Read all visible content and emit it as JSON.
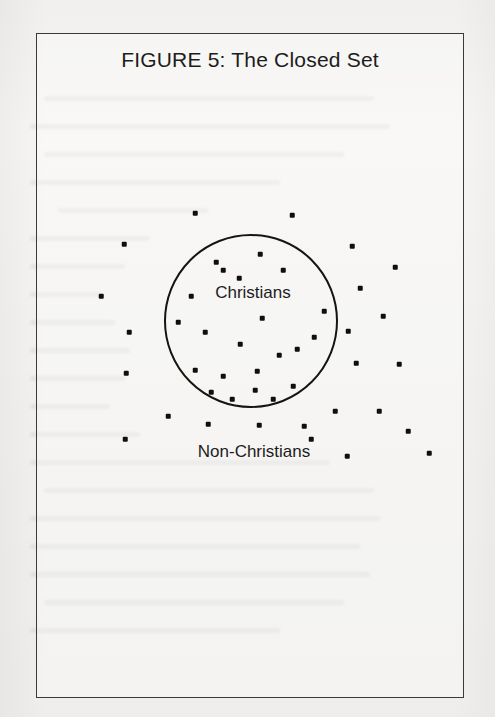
{
  "document": {
    "background_color": "#f6f5f3",
    "ink_color": "#1d1c1b"
  },
  "figure": {
    "title": "FIGURE 5: The Closed Set",
    "frame": {
      "x": 36,
      "y": 33,
      "width": 428,
      "height": 665,
      "border_color": "#3b3a38"
    }
  },
  "labels": {
    "inside": "Christians",
    "outside": "Non-Christians"
  },
  "ghost_text_lines": [
    {
      "x": 44,
      "y": 96,
      "w": 330
    },
    {
      "x": 30,
      "y": 124,
      "w": 360
    },
    {
      "x": 44,
      "y": 152,
      "w": 300
    },
    {
      "x": 30,
      "y": 180,
      "w": 250
    },
    {
      "x": 58,
      "y": 208,
      "w": 150
    },
    {
      "x": 30,
      "y": 236,
      "w": 120
    },
    {
      "x": 30,
      "y": 264,
      "w": 95
    },
    {
      "x": 30,
      "y": 292,
      "w": 70
    },
    {
      "x": 30,
      "y": 320,
      "w": 85
    },
    {
      "x": 30,
      "y": 348,
      "w": 100
    },
    {
      "x": 30,
      "y": 376,
      "w": 95
    },
    {
      "x": 30,
      "y": 404,
      "w": 80
    },
    {
      "x": 30,
      "y": 432,
      "w": 110
    },
    {
      "x": 30,
      "y": 460,
      "w": 300
    },
    {
      "x": 44,
      "y": 488,
      "w": 330
    },
    {
      "x": 30,
      "y": 516,
      "w": 350
    },
    {
      "x": 30,
      "y": 544,
      "w": 330
    },
    {
      "x": 30,
      "y": 572,
      "w": 340
    },
    {
      "x": 44,
      "y": 600,
      "w": 300
    },
    {
      "x": 30,
      "y": 628,
      "w": 250
    }
  ],
  "chart_data": {
    "type": "scatter",
    "title": "FIGURE 5: The Closed Set",
    "subtitle": "",
    "xlabel": "",
    "ylabel": "",
    "grid": false,
    "legend_position": "none",
    "boundary": {
      "shape": "circle",
      "center": [
        250,
        320
      ],
      "radius": 87,
      "stroke": "#15140f",
      "stroke_width": 2,
      "fill": "none"
    },
    "annotations": [
      {
        "text": "Christians",
        "x": 252,
        "y": 292
      },
      {
        "text": "Non-Christians",
        "x": 253,
        "y": 451
      }
    ],
    "series": [
      {
        "name": "Christians",
        "region": "inside",
        "marker": "square-dot",
        "color": "#100f0d",
        "count": 22,
        "points": [
          [
            215,
            261
          ],
          [
            222,
            269
          ],
          [
            259,
            253
          ],
          [
            238,
            277
          ],
          [
            282,
            269
          ],
          [
            190,
            295
          ],
          [
            177,
            321
          ],
          [
            261,
            317
          ],
          [
            323,
            310
          ],
          [
            204,
            331
          ],
          [
            239,
            343
          ],
          [
            313,
            336
          ],
          [
            296,
            348
          ],
          [
            278,
            354
          ],
          [
            194,
            369
          ],
          [
            222,
            375
          ],
          [
            256,
            370
          ],
          [
            254,
            389
          ],
          [
            292,
            385
          ],
          [
            231,
            398
          ],
          [
            210,
            391
          ],
          [
            272,
            398
          ]
        ]
      },
      {
        "name": "Non-Christians",
        "region": "outside",
        "marker": "square-dot",
        "color": "#100f0d",
        "count": 24,
        "points": [
          [
            194,
            212
          ],
          [
            291,
            214
          ],
          [
            123,
            243
          ],
          [
            351,
            245
          ],
          [
            100,
            295
          ],
          [
            394,
            266
          ],
          [
            359,
            287
          ],
          [
            128,
            331
          ],
          [
            382,
            315
          ],
          [
            347,
            330
          ],
          [
            125,
            372
          ],
          [
            355,
            362
          ],
          [
            398,
            363
          ],
          [
            334,
            410
          ],
          [
            378,
            410
          ],
          [
            303,
            425
          ],
          [
            407,
            430
          ],
          [
            167,
            415
          ],
          [
            124,
            438
          ],
          [
            207,
            423
          ],
          [
            258,
            424
          ],
          [
            310,
            438
          ],
          [
            346,
            455
          ],
          [
            428,
            452
          ]
        ]
      }
    ],
    "xlim": [
      36,
      464
    ],
    "ylim": [
      33,
      698
    ]
  }
}
